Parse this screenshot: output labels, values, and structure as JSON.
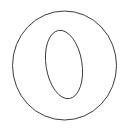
{
  "canvas": {
    "width": 129,
    "height": 131,
    "background_color": "#ffffff",
    "title": "letter-o-outline"
  },
  "artwork": {
    "name": "letter-o-outline",
    "description": "Outline drawing of the letter O (or digit zero) rendered as two nested ellipse contours",
    "stroke_color": "#3a3a3a",
    "fill_color": "none",
    "stroke_width": 1,
    "shapes": [
      {
        "name": "outer-contour",
        "type": "ellipse",
        "cx": 64.5,
        "cy": 65.5,
        "rx": 52,
        "ry": 54.5,
        "rotation": 0
      },
      {
        "name": "inner-counter-contour",
        "type": "ellipse",
        "cx": 64,
        "cy": 64.5,
        "rx": 18,
        "ry": 34.5,
        "rotation": -9
      }
    ]
  }
}
